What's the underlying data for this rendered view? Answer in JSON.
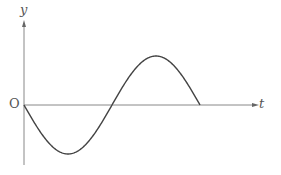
{
  "diagram": {
    "title": "",
    "axes": {
      "x_label": "t",
      "y_label": "y",
      "origin_label": "O"
    },
    "curve": {
      "type": "sine",
      "description": "One full period of y = -sin(t), starting at origin going down, trough then peak, ending on t-axis",
      "color": "#444444"
    },
    "axis_color": "#888888"
  }
}
